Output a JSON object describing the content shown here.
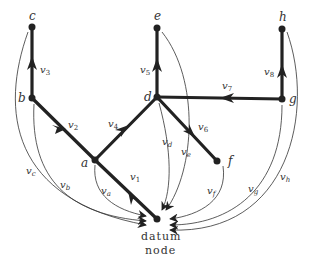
{
  "diagram": {
    "type": "graph",
    "nodes": [
      {
        "id": "a",
        "label": "a",
        "x": 95,
        "y": 160
      },
      {
        "id": "b",
        "label": "b",
        "x": 32,
        "y": 98
      },
      {
        "id": "c",
        "label": "c",
        "x": 32,
        "y": 27
      },
      {
        "id": "d",
        "label": "d",
        "x": 157,
        "y": 97
      },
      {
        "id": "e",
        "label": "e",
        "x": 157,
        "y": 28
      },
      {
        "id": "f",
        "label": "f",
        "x": 217,
        "y": 161
      },
      {
        "id": "g",
        "label": "g",
        "x": 282,
        "y": 99
      },
      {
        "id": "h",
        "label": "h",
        "x": 282,
        "y": 29
      },
      {
        "id": "datum",
        "label_line1": "datum",
        "label_line2": "node",
        "x": 157,
        "y": 219
      }
    ],
    "branches": [
      {
        "id": "v1",
        "label": "v1",
        "from": "datum",
        "to": "a"
      },
      {
        "id": "v2",
        "label": "v2",
        "from": "b",
        "to": "a"
      },
      {
        "id": "v3",
        "label": "v3",
        "from": "b",
        "to": "c"
      },
      {
        "id": "v4",
        "label": "v4",
        "from": "a",
        "to": "d"
      },
      {
        "id": "v5",
        "label": "v5",
        "from": "d",
        "to": "e"
      },
      {
        "id": "v6",
        "label": "v6",
        "from": "d",
        "to": "f"
      },
      {
        "id": "v7",
        "label": "v7",
        "from": "g",
        "to": "d"
      },
      {
        "id": "v8",
        "label": "v8",
        "from": "g",
        "to": "h"
      }
    ],
    "node_voltages": [
      {
        "id": "va",
        "label": "va",
        "from": "a",
        "to": "datum"
      },
      {
        "id": "vb",
        "label": "vb",
        "from": "b",
        "to": "datum"
      },
      {
        "id": "vc",
        "label": "vc",
        "from": "c",
        "to": "datum"
      },
      {
        "id": "vd",
        "label": "vd",
        "from": "d",
        "to": "datum"
      },
      {
        "id": "ve",
        "label": "ve",
        "from": "e",
        "to": "datum"
      },
      {
        "id": "vf",
        "label": "vf",
        "from": "f",
        "to": "datum"
      },
      {
        "id": "vg",
        "label": "vg",
        "from": "g",
        "to": "datum"
      },
      {
        "id": "vh",
        "label": "vh",
        "from": "h",
        "to": "datum"
      }
    ],
    "colors": {
      "line": "#222222",
      "text": "#333333",
      "background": "#ffffff"
    }
  }
}
